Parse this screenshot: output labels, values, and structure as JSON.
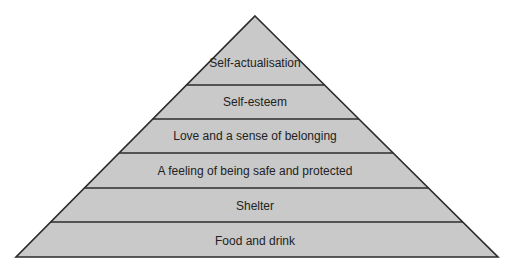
{
  "diagram": {
    "type": "pyramid",
    "colors": {
      "fill": "#c9c9c9",
      "stroke": "#2b2b2b",
      "text": "#222222",
      "background": "#ffffff"
    },
    "levels": [
      {
        "label": "Self-actualisation"
      },
      {
        "label": "Self-esteem"
      },
      {
        "label": "Love and a sense of belonging"
      },
      {
        "label": "A feeling of being safe and protected"
      },
      {
        "label": "Shelter"
      },
      {
        "label": "Food and drink"
      }
    ]
  }
}
